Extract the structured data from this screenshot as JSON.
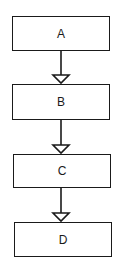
{
  "diagram": {
    "type": "flowchart",
    "direction": "top-to-bottom",
    "nodes": [
      {
        "id": "A",
        "label": "A"
      },
      {
        "id": "B",
        "label": "B"
      },
      {
        "id": "C",
        "label": "C"
      },
      {
        "id": "D",
        "label": "D"
      }
    ],
    "edges": [
      {
        "from": "A",
        "to": "B",
        "arrowhead": "open-triangle"
      },
      {
        "from": "B",
        "to": "C",
        "arrowhead": "open-triangle"
      },
      {
        "from": "C",
        "to": "D",
        "arrowhead": "open-triangle"
      }
    ],
    "colors": {
      "stroke": "#1a1a1a",
      "background": "#ffffff"
    }
  }
}
